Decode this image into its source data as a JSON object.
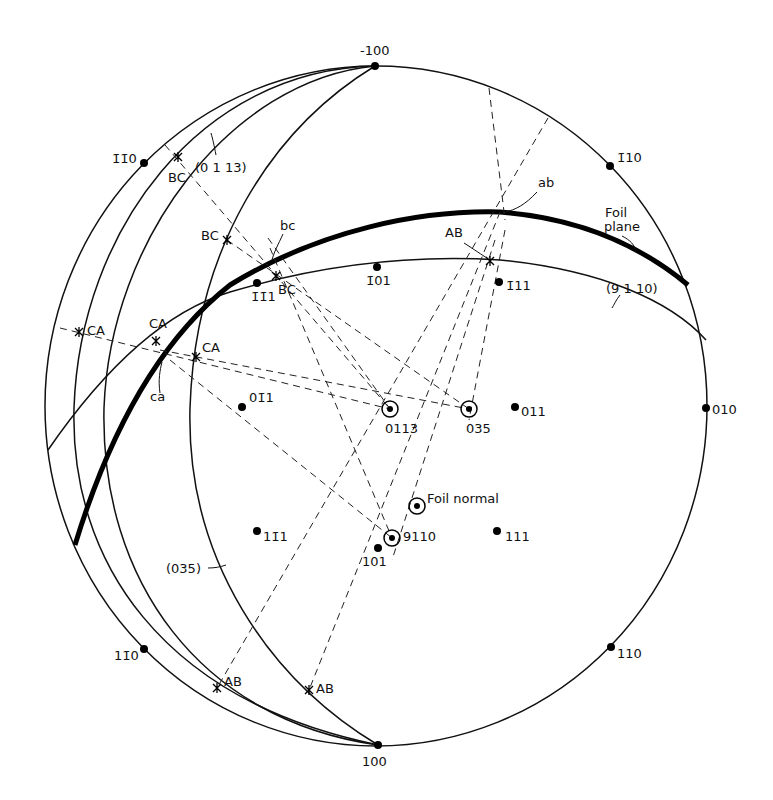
{
  "figure": {
    "type": "stereographic projection",
    "poles": [
      {
        "label": "̅100",
        "display": "-100",
        "x": 375,
        "y": 66,
        "lx": 360,
        "ly": 55
      },
      {
        "label": "100",
        "display": "100",
        "x": 378,
        "y": 745,
        "lx": 362,
        "ly": 766
      },
      {
        "label": "010",
        "display": "010",
        "x": 706,
        "y": 408,
        "lx": 712,
        "ly": 414
      },
      {
        "label": "-1-10",
        "display": "1̄1̄0",
        "x": 144,
        "y": 163,
        "lx": 112,
        "ly": 163
      },
      {
        "label": "-110",
        "display": "1̄10",
        "x": 610,
        "y": 166,
        "lx": 617,
        "ly": 162
      },
      {
        "label": "1-10",
        "display": "11̄0",
        "x": 144,
        "y": 649,
        "lx": 114,
        "ly": 660
      },
      {
        "label": "110",
        "display": "110",
        "x": 611,
        "y": 647,
        "lx": 617,
        "ly": 658
      },
      {
        "label": "-101",
        "display": "1̄01",
        "x": 377,
        "y": 267,
        "lx": 366,
        "ly": 285
      },
      {
        "label": "-1-11",
        "display": "1̄1̄1",
        "x": 257,
        "y": 283,
        "lx": 251,
        "ly": 301
      },
      {
        "label": "-111",
        "display": "1̄11",
        "x": 499,
        "y": 282,
        "lx": 506,
        "ly": 290
      },
      {
        "label": "0-11",
        "display": "01̄1",
        "x": 242,
        "y": 407,
        "lx": 249,
        "ly": 402
      },
      {
        "label": "011",
        "display": "011",
        "x": 515,
        "y": 407,
        "lx": 521,
        "ly": 416
      },
      {
        "label": "1-11",
        "display": "11̄1",
        "x": 257,
        "y": 531,
        "lx": 263,
        "ly": 541
      },
      {
        "label": "111",
        "display": "111",
        "x": 497,
        "y": 531,
        "lx": 505,
        "ly": 541
      },
      {
        "label": "101",
        "display": "101",
        "x": 378,
        "y": 548,
        "lx": 362,
        "ly": 566
      }
    ],
    "special_poles": [
      {
        "label": "0113",
        "display": "0113",
        "x": 390,
        "y": 409,
        "lx": 385,
        "ly": 433
      },
      {
        "label": "035",
        "display": "035",
        "x": 469,
        "y": 409,
        "lx": 466,
        "ly": 433
      },
      {
        "label": "9110",
        "display": "9110",
        "x": 392,
        "y": 538,
        "lx": 403,
        "ly": 541
      },
      {
        "label": "Foil normal",
        "display": "Foil normal",
        "x": 417,
        "y": 506,
        "lx": 427,
        "ly": 503
      }
    ],
    "intersection_markers": [
      {
        "label": "BC",
        "x": 178,
        "y": 157,
        "lx": 168,
        "ly": 182
      },
      {
        "label": "BC",
        "x": 227,
        "y": 240,
        "lx": 201,
        "ly": 240
      },
      {
        "label": "BC",
        "x": 276,
        "y": 276,
        "lx": 278,
        "ly": 294
      },
      {
        "label": "CA",
        "x": 79,
        "y": 332,
        "lx": 87,
        "ly": 335
      },
      {
        "label": "CA",
        "x": 156,
        "y": 341,
        "lx": 149,
        "ly": 328
      },
      {
        "label": "CA",
        "x": 196,
        "y": 357,
        "lx": 202,
        "ly": 352
      },
      {
        "label": "AB",
        "x": 490,
        "y": 261,
        "lx": 445,
        "ly": 237
      },
      {
        "label": "AB",
        "x": 217,
        "y": 688,
        "lx": 224,
        "ly": 686
      },
      {
        "label": "AB",
        "x": 309,
        "y": 690,
        "lx": 316,
        "ly": 693
      }
    ],
    "annotations": [
      {
        "text": "(0 1 13)",
        "x": 195,
        "y": 172
      },
      {
        "text": "bc",
        "x": 280,
        "y": 230
      },
      {
        "text": "ab",
        "x": 538,
        "y": 187
      },
      {
        "text": "Foil",
        "x": 605,
        "y": 217
      },
      {
        "text": "plane",
        "x": 604,
        "y": 231
      },
      {
        "text": "(9 1 10)",
        "x": 606,
        "y": 293
      },
      {
        "text": "(035)",
        "x": 166,
        "y": 573
      },
      {
        "text": "ca",
        "x": 150,
        "y": 401
      }
    ],
    "great_circles": [
      "primitive",
      "(0 1 13)",
      "(035)",
      "Foil plane",
      "(9 1 10)",
      "outer (0 1 13) companion"
    ]
  }
}
